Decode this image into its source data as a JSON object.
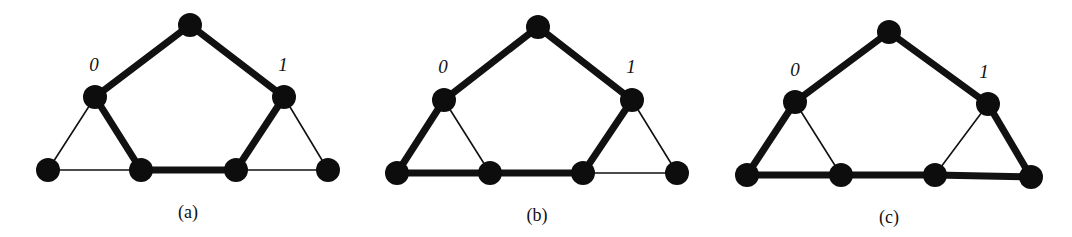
{
  "figure": {
    "colors": {
      "ink": "#111111",
      "background": "#ffffff"
    },
    "node_radius": 12,
    "panels": [
      {
        "id": "a",
        "caption": "(a)",
        "caption_pos": [
          188,
          218
        ],
        "nodes": [
          {
            "id": "top",
            "x": 190,
            "y": 25
          },
          {
            "id": "v0",
            "x": 95,
            "y": 97,
            "label": "0",
            "label_pos": [
              94,
              71
            ]
          },
          {
            "id": "v1",
            "x": 284,
            "y": 97,
            "label": "1",
            "label_pos": [
              283,
              71
            ]
          },
          {
            "id": "b1",
            "x": 48,
            "y": 170
          },
          {
            "id": "b2",
            "x": 141,
            "y": 170
          },
          {
            "id": "b3",
            "x": 236,
            "y": 170
          },
          {
            "id": "b4",
            "x": 328,
            "y": 170
          }
        ],
        "edges": [
          {
            "from": "top",
            "to": "v0",
            "bold": true
          },
          {
            "from": "top",
            "to": "v1",
            "bold": true
          },
          {
            "from": "v0",
            "to": "b2",
            "bold": true
          },
          {
            "from": "b2",
            "to": "b3",
            "bold": true
          },
          {
            "from": "b3",
            "to": "v1",
            "bold": true
          },
          {
            "from": "v0",
            "to": "b1",
            "bold": false
          },
          {
            "from": "b1",
            "to": "b2",
            "bold": false
          },
          {
            "from": "v1",
            "to": "b4",
            "bold": false
          },
          {
            "from": "b3",
            "to": "b4",
            "bold": false
          }
        ]
      },
      {
        "id": "b",
        "caption": "(b)",
        "caption_pos": [
          537,
          221
        ],
        "nodes": [
          {
            "id": "top",
            "x": 538,
            "y": 27
          },
          {
            "id": "v0",
            "x": 444,
            "y": 100,
            "label": "0",
            "label_pos": [
              443,
              73
            ]
          },
          {
            "id": "v1",
            "x": 632,
            "y": 100,
            "label": "1",
            "label_pos": [
              631,
              73
            ]
          },
          {
            "id": "b1",
            "x": 397,
            "y": 173
          },
          {
            "id": "b2",
            "x": 490,
            "y": 173
          },
          {
            "id": "b3",
            "x": 583,
            "y": 173
          },
          {
            "id": "b4",
            "x": 677,
            "y": 173
          }
        ],
        "edges": [
          {
            "from": "top",
            "to": "v0",
            "bold": true
          },
          {
            "from": "top",
            "to": "v1",
            "bold": true
          },
          {
            "from": "v0",
            "to": "b1",
            "bold": true
          },
          {
            "from": "b1",
            "to": "b2",
            "bold": true
          },
          {
            "from": "b2",
            "to": "b3",
            "bold": true
          },
          {
            "from": "b3",
            "to": "v1",
            "bold": true
          },
          {
            "from": "v0",
            "to": "b2",
            "bold": false
          },
          {
            "from": "v1",
            "to": "b4",
            "bold": false
          },
          {
            "from": "b3",
            "to": "b4",
            "bold": false
          }
        ]
      },
      {
        "id": "c",
        "caption": "(c)",
        "caption_pos": [
          889,
          223
        ],
        "nodes": [
          {
            "id": "top",
            "x": 889,
            "y": 32
          },
          {
            "id": "v0",
            "x": 795,
            "y": 102,
            "label": "0",
            "label_pos": [
              795,
              76
            ]
          },
          {
            "id": "v1",
            "x": 988,
            "y": 104,
            "label": "1",
            "label_pos": [
              984,
              78
            ]
          },
          {
            "id": "b1",
            "x": 747,
            "y": 175
          },
          {
            "id": "b2",
            "x": 841,
            "y": 175
          },
          {
            "id": "b3",
            "x": 935,
            "y": 175
          },
          {
            "id": "b4",
            "x": 1031,
            "y": 177
          }
        ],
        "edges": [
          {
            "from": "top",
            "to": "v0",
            "bold": true
          },
          {
            "from": "top",
            "to": "v1",
            "bold": true
          },
          {
            "from": "v0",
            "to": "b1",
            "bold": true
          },
          {
            "from": "b1",
            "to": "b2",
            "bold": true
          },
          {
            "from": "b2",
            "to": "b3",
            "bold": true
          },
          {
            "from": "b3",
            "to": "b4",
            "bold": true
          },
          {
            "from": "v1",
            "to": "b4",
            "bold": true
          },
          {
            "from": "v0",
            "to": "b2",
            "bold": false
          },
          {
            "from": "v1",
            "to": "b3",
            "bold": false
          }
        ]
      }
    ]
  }
}
